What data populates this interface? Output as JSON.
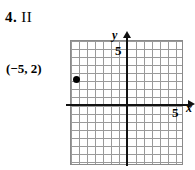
{
  "problem": {
    "number": "4.",
    "answer": "II"
  },
  "graph": {
    "y_axis_label": "y",
    "x_axis_label": "x",
    "y_tick_label": "5",
    "x_tick_label": "5",
    "point_label": "(−5, 2)",
    "grid_color": "#9a9a9a",
    "axis_color": "#111111",
    "point_color": "#000000"
  },
  "chart_data": {
    "type": "scatter",
    "title": "",
    "xlabel": "x",
    "ylabel": "y",
    "xlim": [
      -7,
      7
    ],
    "ylim": [
      -8,
      8
    ],
    "grid": true,
    "gridstep": 1,
    "xticks": [
      5
    ],
    "yticks": [
      5
    ],
    "legend": null,
    "points": [
      {
        "x": -5,
        "y": 2,
        "label": "(−5, 2)"
      }
    ],
    "annotations": [
      {
        "text": "4. II",
        "role": "problem-answer-quadrant"
      }
    ]
  }
}
